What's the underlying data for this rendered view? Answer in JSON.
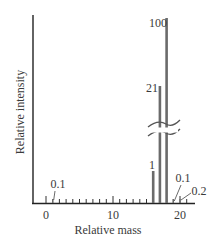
{
  "chart_data": {
    "type": "bar",
    "title": "",
    "xlabel": "Relative mass",
    "ylabel": "Relative intensity",
    "xlim": [
      -2,
      22
    ],
    "x_ticks": [
      0,
      10,
      20
    ],
    "x_tick_labels": [
      "0",
      "10",
      "20"
    ],
    "minor_ticks_every": 1,
    "y_axis_break": true,
    "grid": false,
    "legend": null,
    "x": [
      1,
      16,
      17,
      18,
      19,
      20
    ],
    "values": [
      0.1,
      1,
      21,
      100,
      0.1,
      0.2
    ],
    "annotations": [
      {
        "x": 1,
        "text": "0.1"
      },
      {
        "x": 16,
        "text": "1"
      },
      {
        "x": 17,
        "text": "21"
      },
      {
        "x": 18,
        "text": "100"
      },
      {
        "x": 19,
        "text": "0.1"
      },
      {
        "x": 20,
        "text": "0.2"
      }
    ],
    "bar_color": "#6b6b6b",
    "axis_color": "#222222"
  }
}
